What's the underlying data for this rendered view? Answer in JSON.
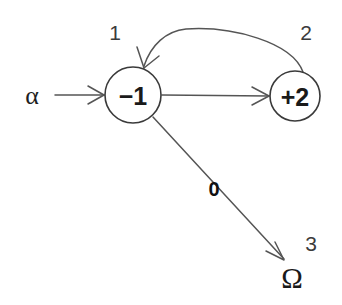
{
  "canvas": {
    "width": 342,
    "height": 305,
    "background": "#ffffff",
    "stroke_color": "#555555",
    "node_stroke_color": "#3a3a3a",
    "text_color": "#1a1a1a"
  },
  "diagram": {
    "type": "state-transition-graph",
    "nodes": [
      {
        "id": "node-1",
        "value": "−1",
        "index_label": "1",
        "cx": 133,
        "cy": 95,
        "r": 28
      },
      {
        "id": "node-2",
        "value": "+2",
        "index_label": "2",
        "cx": 295,
        "cy": 96,
        "r": 25
      }
    ],
    "terminal": {
      "id": "terminal-omega",
      "symbol": "Ω",
      "index_label": "3",
      "x": 292,
      "y": 278
    },
    "input": {
      "id": "input-alpha",
      "symbol": "α",
      "x": 32,
      "y": 95
    },
    "edges": [
      {
        "id": "edge-alpha-to-node1",
        "from": "input-alpha",
        "to": "node-1",
        "shape": "straight",
        "label": ""
      },
      {
        "id": "edge-node1-to-node2",
        "from": "node-1",
        "to": "node-2",
        "shape": "straight",
        "label": ""
      },
      {
        "id": "edge-node2-to-node1",
        "from": "node-2",
        "to": "node-1",
        "shape": "arc",
        "label": ""
      },
      {
        "id": "edge-node1-to-omega",
        "from": "node-1",
        "to": "terminal-omega",
        "shape": "straight",
        "label": "0"
      }
    ]
  }
}
